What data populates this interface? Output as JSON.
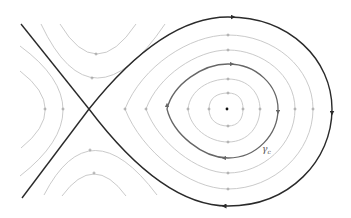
{
  "diagram": {
    "type": "phase-portrait",
    "colors": {
      "background": "#ffffff",
      "separatrix": "#2a2a2a",
      "orbit": "#bdbdbd",
      "highlighted_orbit": "#666666",
      "tick": "#9a9a9a",
      "center_point": "#111111",
      "label": "#555555"
    },
    "saddle_point": {
      "x": 89,
      "y": 109
    },
    "center_point": {
      "x": 227,
      "y": 109
    },
    "labels": {
      "gamma": "γ",
      "gamma_subscript": "c"
    },
    "elements": [
      "separatrix-homoclinic-loop",
      "separatrix-incoming-branches",
      "nested-closed-orbits",
      "highlighted-orbit-gamma-c",
      "hyperbolic-trajectories-top",
      "hyperbolic-trajectories-bottom",
      "hyperbolic-trajectories-left"
    ]
  }
}
